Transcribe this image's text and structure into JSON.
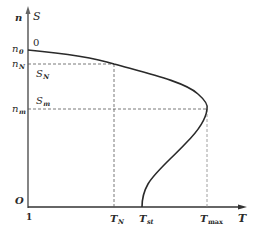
{
  "diagram": {
    "colors": {
      "axis": "#555555",
      "curve": "#2a2a2a",
      "dashed": "#555555",
      "text": "#2a2a2a",
      "background": "#ffffff"
    },
    "axes": {
      "y_left_label": "n",
      "y_right_label": "S",
      "x_label": "T",
      "origin_left_label": "O",
      "origin_bottom_label": "1",
      "top_zero_label": "0"
    },
    "y_ticks": [
      {
        "main": "n",
        "sub": "0"
      },
      {
        "main": "n",
        "sub": "N"
      },
      {
        "main": "n",
        "sub": "m"
      }
    ],
    "x_ticks": [
      {
        "main": "T",
        "sub": "N"
      },
      {
        "main": "T",
        "sub": "st"
      },
      {
        "main": "T",
        "sub": "max"
      }
    ],
    "slip_labels": [
      {
        "main": "S",
        "sub": "N"
      },
      {
        "main": "S",
        "sub": "m"
      }
    ],
    "points": {
      "no_load": {
        "label": "n0 / S=0",
        "T": 0
      },
      "rated": {
        "label": "(TN, nN)"
      },
      "critical": {
        "label": "(Tmax, nm)"
      },
      "starting": {
        "label": "(Tst, 0) / S=1"
      }
    }
  }
}
